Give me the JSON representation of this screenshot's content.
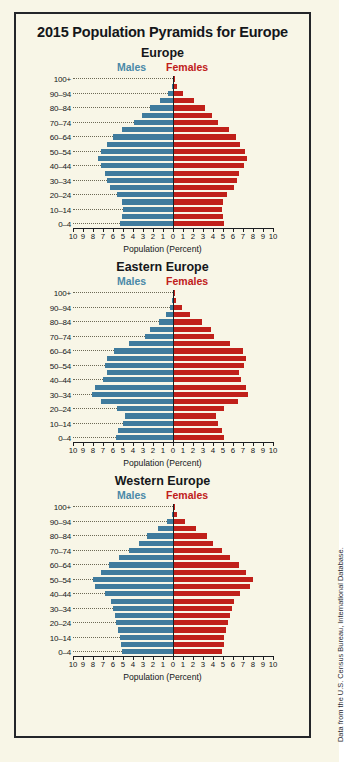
{
  "title": "2015 Population Pyramids for Europe",
  "source_note": "Data from the U.S. Census Bureau, International Database.",
  "legend": {
    "males": "Males",
    "females": "Females",
    "male_color": "#3f7b9d",
    "female_color": "#c0201a"
  },
  "axis": {
    "xlabel": "Population (Percent)",
    "tick_labels": [
      "10",
      "9",
      "8",
      "7",
      "6",
      "5",
      "4",
      "3",
      "2",
      "1",
      "0",
      "1",
      "2",
      "3",
      "4",
      "5",
      "6",
      "7",
      "8",
      "9",
      "10"
    ],
    "xmax": 10
  },
  "age_groups_labeled": [
    "100+",
    "90–94",
    "80–84",
    "70–74",
    "60–64",
    "50–54",
    "40–44",
    "30–34",
    "20–24",
    "10–14",
    "0–4"
  ],
  "panels": [
    {
      "name": "Europe"
    },
    {
      "name": "Eastern Europe"
    },
    {
      "name": "Western Europe"
    }
  ],
  "chart_data": [
    {
      "type": "bar",
      "title": "Europe",
      "subtype": "population-pyramid",
      "xlabel": "Population (Percent)",
      "ylabel": "",
      "xlim": [
        -10,
        10
      ],
      "grid": false,
      "legend_position": "top",
      "categories": [
        "0–4",
        "5–9",
        "10–14",
        "15–19",
        "20–24",
        "25–29",
        "30–34",
        "35–39",
        "40–44",
        "45–49",
        "50–54",
        "55–59",
        "60–64",
        "65–69",
        "70–74",
        "75–79",
        "80–84",
        "85–89",
        "90–94",
        "95–99",
        "100+"
      ],
      "series": [
        {
          "name": "Males",
          "color": "#3f7b9d",
          "values": [
            5.3,
            5.1,
            5.0,
            5.1,
            5.6,
            6.3,
            6.6,
            6.8,
            7.2,
            7.5,
            7.2,
            6.6,
            6.0,
            5.1,
            3.9,
            3.1,
            2.3,
            1.3,
            0.5,
            0.1,
            0.0
          ]
        },
        {
          "name": "Females",
          "color": "#c0201a",
          "values": [
            5.0,
            4.9,
            4.8,
            4.9,
            5.3,
            6.0,
            6.3,
            6.5,
            7.0,
            7.3,
            7.1,
            6.6,
            6.2,
            5.5,
            4.4,
            3.8,
            3.1,
            2.0,
            0.9,
            0.3,
            0.1
          ]
        }
      ]
    },
    {
      "type": "bar",
      "title": "Eastern Europe",
      "subtype": "population-pyramid",
      "xlabel": "Population (Percent)",
      "ylabel": "",
      "xlim": [
        -10,
        10
      ],
      "grid": false,
      "legend_position": "top",
      "categories": [
        "0–4",
        "5–9",
        "10–14",
        "15–19",
        "20–24",
        "25–29",
        "30–34",
        "35–39",
        "40–44",
        "45–49",
        "50–54",
        "55–59",
        "60–64",
        "65–69",
        "70–74",
        "75–79",
        "80–84",
        "85–89",
        "90–94",
        "95–99",
        "100+"
      ],
      "series": [
        {
          "name": "Males",
          "color": "#3f7b9d",
          "values": [
            5.7,
            5.5,
            5.0,
            4.8,
            5.6,
            7.2,
            8.1,
            7.8,
            7.0,
            6.6,
            6.8,
            6.6,
            5.9,
            4.4,
            2.8,
            2.3,
            1.4,
            0.7,
            0.3,
            0.1,
            0.0
          ]
        },
        {
          "name": "Females",
          "color": "#c0201a",
          "values": [
            5.0,
            4.8,
            4.4,
            4.2,
            5.0,
            6.4,
            7.4,
            7.2,
            6.7,
            6.5,
            7.0,
            7.2,
            6.9,
            5.6,
            4.0,
            3.7,
            2.8,
            1.6,
            0.8,
            0.2,
            0.1
          ]
        }
      ]
    },
    {
      "type": "bar",
      "title": "Western Europe",
      "subtype": "population-pyramid",
      "xlabel": "Population (Percent)",
      "ylabel": "",
      "xlim": [
        -10,
        10
      ],
      "grid": false,
      "legend_position": "top",
      "categories": [
        "0–4",
        "5–9",
        "10–14",
        "15–19",
        "20–24",
        "25–29",
        "30–34",
        "35–39",
        "40–44",
        "45–49",
        "50–54",
        "55–59",
        "60–64",
        "65–69",
        "70–74",
        "75–79",
        "80–84",
        "85–89",
        "90–94",
        "95–99",
        "100+"
      ],
      "series": [
        {
          "name": "Males",
          "color": "#3f7b9d",
          "values": [
            5.1,
            5.2,
            5.3,
            5.5,
            5.7,
            5.8,
            6.0,
            6.2,
            6.8,
            7.8,
            8.0,
            7.2,
            6.4,
            5.4,
            4.4,
            3.4,
            2.6,
            1.5,
            0.6,
            0.1,
            0.0
          ]
        },
        {
          "name": "Females",
          "color": "#c0201a",
          "values": [
            4.8,
            5.0,
            5.0,
            5.2,
            5.4,
            5.6,
            5.8,
            6.0,
            6.6,
            7.6,
            7.9,
            7.2,
            6.5,
            5.6,
            4.8,
            3.9,
            3.3,
            2.2,
            1.1,
            0.3,
            0.1
          ]
        }
      ]
    }
  ]
}
